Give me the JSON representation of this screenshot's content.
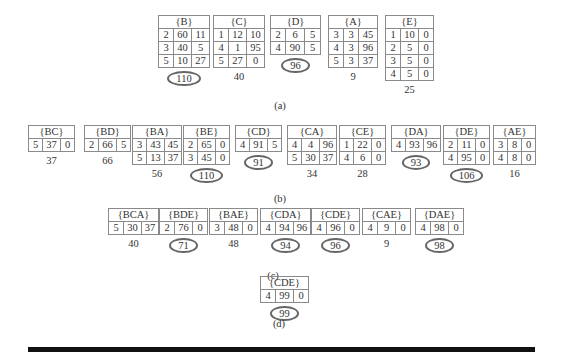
{
  "figure": {
    "rows": [
      {
        "label": "(a)",
        "tables": [
          {
            "name": "{B}",
            "rows": [
              [
                "2",
                "60",
                "11"
              ],
              [
                "3",
                "40",
                "5"
              ],
              [
                "5",
                "10",
                "27"
              ]
            ],
            "support": "110",
            "circled": true
          },
          {
            "name": "{C}",
            "rows": [
              [
                "1",
                "12",
                "10"
              ],
              [
                "4",
                "1",
                "95"
              ],
              [
                "5",
                "27",
                "0"
              ]
            ],
            "support": "40",
            "circled": false
          },
          {
            "name": "{D}",
            "rows": [
              [
                "2",
                "6",
                "5"
              ],
              [
                "4",
                "90",
                "5"
              ]
            ],
            "support": "96",
            "circled": true
          },
          {
            "name": "{A}",
            "rows": [
              [
                "3",
                "3",
                "45"
              ],
              [
                "4",
                "3",
                "96"
              ],
              [
                "5",
                "3",
                "37"
              ]
            ],
            "support": "9",
            "circled": false
          },
          {
            "name": "{E}",
            "rows": [
              [
                "1",
                "10",
                "0"
              ],
              [
                "2",
                "5",
                "0"
              ],
              [
                "3",
                "5",
                "0"
              ],
              [
                "4",
                "5",
                "0"
              ]
            ],
            "support": "25",
            "circled": false
          }
        ]
      },
      {
        "label": "(b)",
        "tables": [
          {
            "name": "{BC}",
            "rows": [
              [
                "5",
                "37",
                "0"
              ]
            ],
            "support": "37",
            "circled": false
          },
          {
            "name": "{BD}",
            "rows": [
              [
                "2",
                "66",
                "5"
              ]
            ],
            "support": "66",
            "circled": false
          },
          {
            "name": "{BA}",
            "rows": [
              [
                "3",
                "43",
                "45"
              ],
              [
                "5",
                "13",
                "37"
              ]
            ],
            "support": "56",
            "circled": false
          },
          {
            "name": "{BE}",
            "rows": [
              [
                "2",
                "65",
                "0"
              ],
              [
                "3",
                "45",
                "0"
              ]
            ],
            "support": "110",
            "circled": true
          },
          {
            "name": "{CD}",
            "rows": [
              [
                "4",
                "91",
                "5"
              ]
            ],
            "support": "91",
            "circled": true
          },
          {
            "name": "{CA}",
            "rows": [
              [
                "4",
                "4",
                "96"
              ],
              [
                "5",
                "30",
                "37"
              ]
            ],
            "support": "34",
            "circled": false
          },
          {
            "name": "{CE}",
            "rows": [
              [
                "1",
                "22",
                "0"
              ],
              [
                "4",
                "6",
                "0"
              ]
            ],
            "support": "28",
            "circled": false
          },
          {
            "name": "{DA}",
            "rows": [
              [
                "4",
                "93",
                "96"
              ]
            ],
            "support": "93",
            "circled": true
          },
          {
            "name": "{DE}",
            "rows": [
              [
                "2",
                "11",
                "0"
              ],
              [
                "4",
                "95",
                "0"
              ]
            ],
            "support": "106",
            "circled": true
          },
          {
            "name": "{AE}",
            "rows": [
              [
                "3",
                "8",
                "0"
              ],
              [
                "4",
                "8",
                "0"
              ]
            ],
            "support": "16",
            "circled": false
          }
        ]
      },
      {
        "label": "(c)",
        "tables": [
          {
            "name": "{BCA}",
            "rows": [
              [
                "5",
                "30",
                "37"
              ]
            ],
            "support": "40",
            "circled": false
          },
          {
            "name": "{BDE}",
            "rows": [
              [
                "2",
                "76",
                "0"
              ]
            ],
            "support": "71",
            "circled": true
          },
          {
            "name": "{BAE}",
            "rows": [
              [
                "3",
                "48",
                "0"
              ]
            ],
            "support": "48",
            "circled": false
          },
          {
            "name": "{CDA}",
            "rows": [
              [
                "4",
                "94",
                "96"
              ]
            ],
            "support": "94",
            "circled": true
          },
          {
            "name": "{CDE}",
            "rows": [
              [
                "4",
                "96",
                "0"
              ]
            ],
            "support": "96",
            "circled": true
          },
          {
            "name": "{CAE}",
            "rows": [
              [
                "4",
                "9",
                "0"
              ]
            ],
            "support": "9",
            "circled": false
          },
          {
            "name": "{DAE}",
            "rows": [
              [
                "4",
                "98",
                "0"
              ]
            ],
            "support": "98",
            "circled": true
          }
        ]
      },
      {
        "label": "(d)",
        "tables": [
          {
            "name": "{CDE}",
            "rows": [
              [
                "4",
                "99",
                "0"
              ]
            ],
            "support": "99",
            "circled": true
          }
        ]
      }
    ]
  }
}
